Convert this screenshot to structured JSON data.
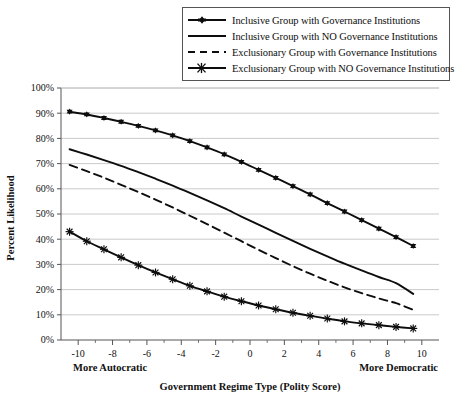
{
  "chart_data": {
    "type": "line",
    "title": "",
    "xlabel": "Government Regime Type (Polity Score)",
    "ylabel": "Percent Likelihood",
    "xlim": [
      -11,
      11
    ],
    "ylim": [
      0,
      100
    ],
    "grid": true,
    "legend_position": "top-right",
    "x_tick_labels": [
      "-10",
      "-8",
      "-6",
      "-4",
      "-2",
      "0",
      "2",
      "4",
      "6",
      "8",
      "10"
    ],
    "x_tick_values": [
      -10,
      -8,
      -6,
      -4,
      -2,
      0,
      2,
      4,
      6,
      8,
      10
    ],
    "x_minor_ticks": [
      -9,
      -7,
      -5,
      -3,
      -1,
      1,
      3,
      5,
      7,
      9
    ],
    "y_tick_labels": [
      "0%",
      "10%",
      "20%",
      "30%",
      "40%",
      "50%",
      "60%",
      "70%",
      "80%",
      "90%",
      "100%"
    ],
    "y_tick_values": [
      0,
      10,
      20,
      30,
      40,
      50,
      60,
      70,
      80,
      90,
      100
    ],
    "axis_end_labels": {
      "left": "More Autocratic",
      "right": "More Democratic"
    },
    "x": [
      -10.5,
      -9.5,
      -8.5,
      -7.5,
      -6.5,
      -5.5,
      -4.5,
      -3.5,
      -2.5,
      -1.5,
      -0.5,
      0.5,
      1.5,
      2.5,
      3.5,
      4.5,
      5.5,
      6.5,
      7.5,
      8.5,
      9.5
    ],
    "series": [
      {
        "name": "Inclusive Group with Governance Institutions",
        "marker": "triangle",
        "dash": "solid",
        "color": "#0d0d0d",
        "values": [
          90.6,
          89.5,
          88.1,
          86.6,
          85.0,
          83.2,
          81.2,
          78.9,
          76.4,
          73.7,
          70.7,
          67.5,
          64.3,
          61.1,
          57.8,
          54.3,
          51.0,
          47.6,
          44.2,
          40.8,
          37.3
        ]
      },
      {
        "name": "Inclusive Group with NO Governance Institutions",
        "marker": "none",
        "dash": "solid",
        "color": "#0d0d0d",
        "values": [
          75.7,
          73.6,
          71.4,
          69.1,
          66.6,
          64.0,
          61.3,
          58.4,
          55.4,
          52.3,
          49.0,
          45.8,
          42.5,
          39.3,
          36.2,
          33.2,
          30.3,
          27.6,
          25.0,
          22.6,
          18.3
        ]
      },
      {
        "name": "Exclusionary Group with Governance Institutions",
        "marker": "none",
        "dash": "dashed",
        "color": "#0d0d0d",
        "values": [
          69.5,
          67.0,
          64.4,
          61.6,
          58.7,
          55.7,
          52.6,
          49.3,
          46.0,
          42.6,
          39.2,
          35.8,
          32.5,
          29.3,
          26.3,
          23.5,
          20.9,
          18.6,
          16.5,
          14.6,
          12.0
        ]
      },
      {
        "name": "Exclusionary Group with NO Governance Institutions",
        "marker": "asterisk",
        "dash": "solid",
        "color": "#0d0d0d",
        "values": [
          43.0,
          39.2,
          36.0,
          32.8,
          29.7,
          26.8,
          24.1,
          21.5,
          19.3,
          17.2,
          15.4,
          13.7,
          12.2,
          10.8,
          9.6,
          8.5,
          7.4,
          6.6,
          5.9,
          5.2,
          4.6
        ]
      }
    ]
  },
  "legend": {
    "items": [
      {
        "label": "Inclusive Group with Governance Institutions",
        "key": "line-marker-triangle"
      },
      {
        "label": "Inclusive Group with NO Governance Institutions",
        "key": "line-solid"
      },
      {
        "label": "Exclusionary Group with Governance Institutions",
        "key": "line-dashed"
      },
      {
        "label": "Exclusionary Group with NO Governance Institutions",
        "key": "line-marker-asterisk"
      }
    ]
  },
  "colors": {
    "ink": "#0d0d0d",
    "grid": "#bdbdbd",
    "axis": "#555555",
    "background": "#ffffff"
  }
}
